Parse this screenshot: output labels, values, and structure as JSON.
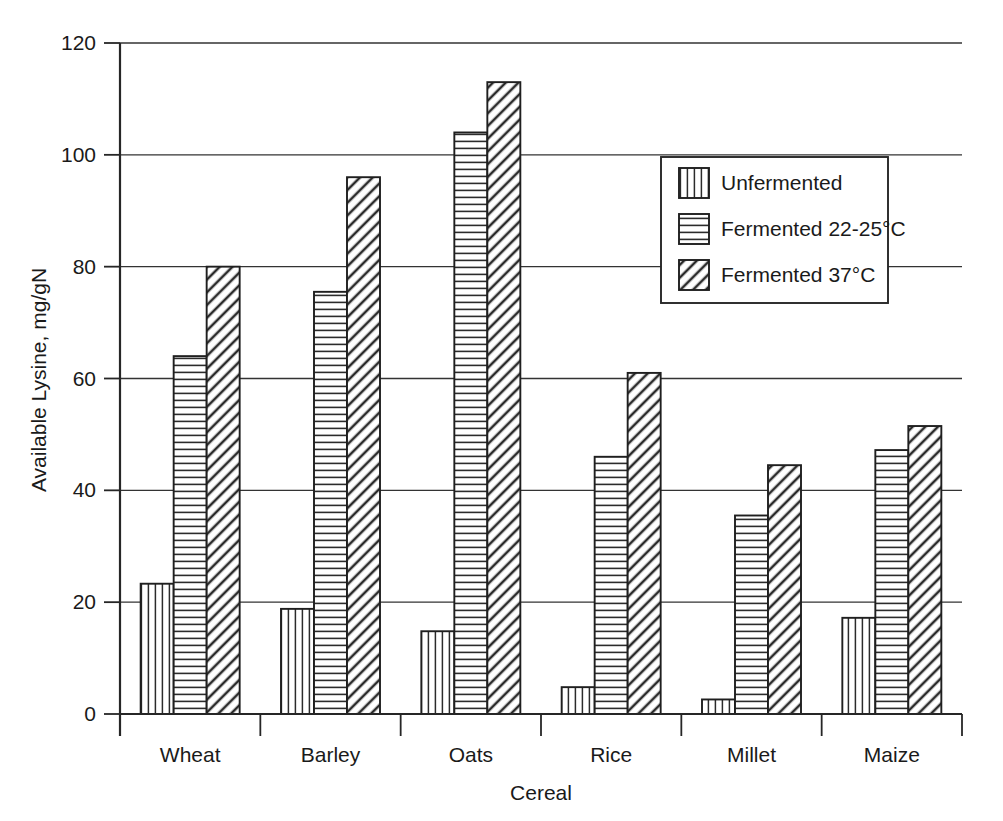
{
  "chart_data": {
    "type": "bar",
    "title": "",
    "xlabel": "Cereal",
    "ylabel": "Available Lysine, mg/gN",
    "categories": [
      "Wheat",
      "Barley",
      "Oats",
      "Rice",
      "Millet",
      "Maize"
    ],
    "series": [
      {
        "name": "Unfermented",
        "pattern": "vertical-lines",
        "values": [
          23.3,
          18.8,
          14.8,
          4.8,
          2.6,
          17.2
        ]
      },
      {
        "name": "Fermented 22-25°C",
        "pattern": "horizontal-lines",
        "values": [
          64.0,
          75.5,
          104.0,
          46.0,
          35.5,
          47.2
        ]
      },
      {
        "name": "Fermented 37°C",
        "pattern": "diagonal-hatch",
        "values": [
          80.0,
          96.0,
          113.0,
          61.0,
          44.5,
          51.5
        ]
      }
    ],
    "ylim": [
      0,
      120
    ],
    "yticks": [
      0,
      20,
      40,
      60,
      80,
      100,
      120
    ],
    "ytick_labels": [
      "0",
      "20",
      "40",
      "60",
      "80",
      "100",
      "120"
    ],
    "grid": "horizontal",
    "legend_position": "upper-right-inside",
    "colors": {
      "line": "#1f1f1f",
      "fill": "#ffffff",
      "text": "#1a1a1a"
    }
  },
  "legend": {
    "entries": [
      {
        "label": "Unfermented"
      },
      {
        "label": "Fermented 22-25°C"
      },
      {
        "label": "Fermented 37°C"
      }
    ]
  }
}
